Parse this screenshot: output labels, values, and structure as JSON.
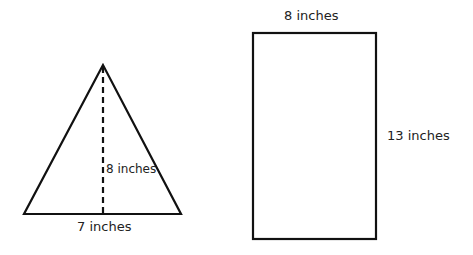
{
  "shapes": {
    "triangle": {
      "base_label": "7 inches",
      "height_label": "8 inches"
    },
    "rectangle": {
      "width_label": "8 inches",
      "height_label": "13 inches"
    }
  },
  "colors": {
    "stroke": "#111111",
    "text": "#222222",
    "background": "#ffffff"
  }
}
